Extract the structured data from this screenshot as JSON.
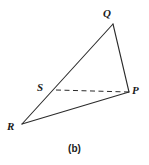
{
  "figure": {
    "caption": "(b)",
    "stroke_color": "#2b2b2b",
    "background_color": "#ffffff",
    "labels": {
      "Q": "Q",
      "P": "P",
      "S": "S",
      "R": "R"
    }
  },
  "chart_data": {
    "type": "diagram",
    "title": "(b)",
    "points": [
      {
        "name": "Q",
        "x": 113,
        "y": 24
      },
      {
        "name": "P",
        "x": 129,
        "y": 92
      },
      {
        "name": "R",
        "x": 22,
        "y": 124
      },
      {
        "name": "S",
        "x": 56,
        "y": 90
      }
    ],
    "edges": [
      {
        "from": "R",
        "to": "Q",
        "style": "solid"
      },
      {
        "from": "Q",
        "to": "P",
        "style": "solid"
      },
      {
        "from": "R",
        "to": "P",
        "style": "solid"
      },
      {
        "from": "S",
        "to": "P",
        "style": "dashed"
      }
    ],
    "xlim": [
      0,
      149
    ],
    "ylim": [
      0,
      165
    ],
    "grid": false,
    "legend": "none"
  }
}
